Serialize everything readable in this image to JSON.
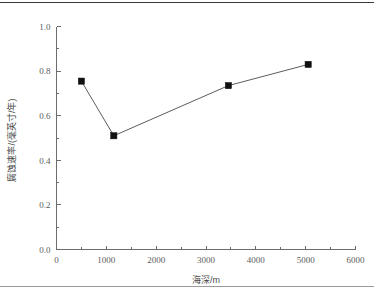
{
  "chart_data": {
    "type": "line",
    "title": "",
    "xlabel": "海深/m",
    "ylabel": "腐蚀速率/(毫英寸/年)",
    "xlim": [
      0,
      6000
    ],
    "ylim": [
      0.0,
      1.0
    ],
    "grid": false,
    "legend": null,
    "x_ticks": [
      0,
      1000,
      2000,
      3000,
      4000,
      5000,
      6000
    ],
    "x_tick_labels": [
      "0",
      "1000",
      "2000",
      "3000",
      "4000",
      "5000",
      "6000"
    ],
    "x_minor_interval": 500,
    "y_ticks": [
      0.0,
      0.2,
      0.4,
      0.6,
      0.8,
      1.0
    ],
    "y_tick_labels": [
      "0.0",
      "0.2",
      "0.4",
      "0.6",
      "0.8",
      "1.0"
    ],
    "y_minor_interval": 0.1,
    "marker": "square",
    "marker_color": "#111111",
    "line_color": "#4a4a4a",
    "series": [
      {
        "name": "腐蚀速率",
        "x": [
          500,
          1150,
          3450,
          5050
        ],
        "y": [
          0.755,
          0.51,
          0.735,
          0.83
        ]
      }
    ]
  },
  "axis": {
    "x_title": "海深/m",
    "y_title": "腐蚀速率/(毫英寸/年)"
  }
}
